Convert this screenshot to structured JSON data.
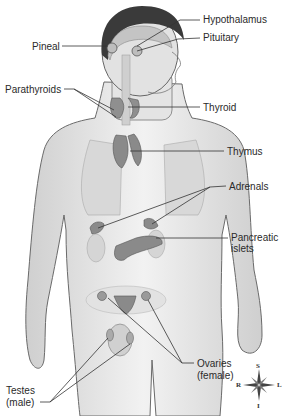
{
  "figure": {
    "labels": {
      "hypothalamus": "Hypothalamus",
      "pituitary": "Pituitary",
      "pineal": "Pineal",
      "parathyroids": "Parathyroids",
      "thyroid": "Thyroid",
      "thymus": "Thymus",
      "adrenals": "Adrenals",
      "pancreatic_1": "Pancreatic",
      "pancreatic_2": "islets",
      "ovaries_1": "Ovaries",
      "ovaries_2": "(female)",
      "testes_1": "Testes",
      "testes_2": "(male)"
    },
    "compass": {
      "S": "S",
      "I": "I",
      "R": "R",
      "L": "L"
    },
    "colors": {
      "skin": "#e6e6e6",
      "outline": "#555555",
      "organ": "#8a8a8a",
      "hair": "#3a3a3a",
      "leader": "#333333"
    }
  }
}
